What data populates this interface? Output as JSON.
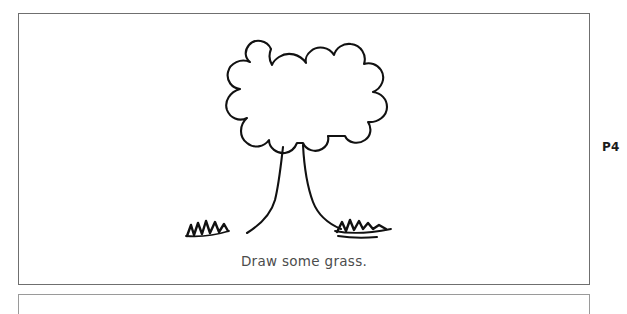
{
  "page": {
    "page_label": "P4",
    "background_color": "#ffffff",
    "border_color": "#6f6f6f"
  },
  "worksheet": {
    "caption": "Draw some grass.",
    "caption_color": "#4c4c4c",
    "instruction_icon": "pencil-prompt"
  },
  "illustration": {
    "name": "tree-line-drawing",
    "stroke_color": "#111111",
    "fill_color": "#ffffff",
    "parts": [
      {
        "name": "tree-canopy",
        "icon": "cloud-shaped-foliage-icon",
        "lobes": 10
      },
      {
        "name": "tree-trunk",
        "icon": "trunk-icon"
      },
      {
        "name": "grass-tuft-left",
        "icon": "grass-zigzag-icon",
        "peaks": 5
      },
      {
        "name": "grass-tuft-right",
        "icon": "grass-zigzag-icon",
        "peaks": 5
      },
      {
        "name": "ground-line-left",
        "icon": "ground-line-icon"
      },
      {
        "name": "ground-line-right",
        "icon": "ground-line-icon"
      }
    ]
  }
}
